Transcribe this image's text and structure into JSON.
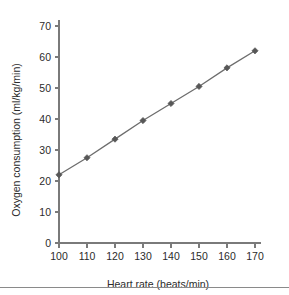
{
  "chart_data": {
    "type": "line",
    "title": "",
    "xlabel": "Heart rate (beats/min)",
    "ylabel": "Oxygen consumption (ml/kg/min)",
    "x": [
      100,
      110,
      120,
      130,
      140,
      150,
      160,
      170
    ],
    "values": [
      22,
      27.5,
      33.5,
      39.5,
      45,
      50.5,
      56.5,
      62
    ],
    "series": [
      {
        "name": "Oxygen consumption",
        "values": [
          22,
          27.5,
          33.5,
          39.5,
          45,
          50.5,
          56.5,
          62
        ]
      }
    ],
    "xlim": [
      100,
      170
    ],
    "ylim": [
      0,
      70
    ],
    "xticks": [
      100,
      110,
      120,
      130,
      140,
      150,
      160,
      170
    ],
    "yticks": [
      0,
      10,
      20,
      30,
      40,
      50,
      60,
      70
    ],
    "xtick_labels": [
      "100",
      "110",
      "120",
      "130",
      "140",
      "150",
      "160",
      "170"
    ],
    "ytick_labels": [
      "0",
      "10",
      "20",
      "30",
      "40",
      "50",
      "60",
      "70"
    ],
    "grid": false,
    "legend": false,
    "marker": "diamond",
    "line_color": "#6d6d6d",
    "marker_color": "#575757",
    "axis_color": "#7a7a7a",
    "text_color": "#2b2b2b",
    "background": "#ffffff"
  },
  "figure": {
    "bottom_rule_color": "#8a8a8a"
  }
}
